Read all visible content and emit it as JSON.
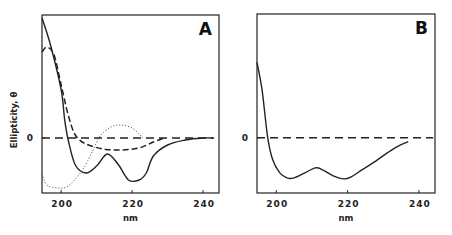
{
  "chart_data": [
    {
      "type": "line",
      "panel": "A",
      "title": "A",
      "xlabel": "nm",
      "ylabel": "Ellipticity, θ",
      "xlim": [
        194.6,
        244.5
      ],
      "ylim": [
        -0.55,
        1.23
      ],
      "xticks": [
        200,
        220,
        240
      ],
      "yticks": [
        {
          "value": 0,
          "label": "0"
        }
      ],
      "zero_line": {
        "style": "dashed",
        "x_range": [
          194.6,
          243
        ]
      },
      "grid": false,
      "series": [
        {
          "name": "solid",
          "style": "solid",
          "x": [
            194.6,
            197,
            200,
            201,
            202,
            204,
            207,
            210,
            213,
            216,
            219,
            222,
            224,
            226,
            230,
            235,
            240,
            243
          ],
          "y": [
            1.2,
            0.93,
            0.48,
            0.18,
            -0.02,
            -0.27,
            -0.35,
            -0.28,
            -0.16,
            -0.26,
            -0.42,
            -0.42,
            -0.35,
            -0.18,
            -0.07,
            -0.02,
            0.0,
            0.0
          ]
        },
        {
          "name": "dashed",
          "style": "dashed",
          "x": [
            194.6,
            196,
            198,
            200,
            202,
            204,
            207,
            212,
            217,
            222,
            226,
            229
          ],
          "y": [
            0.86,
            0.91,
            0.83,
            0.53,
            0.23,
            0.03,
            -0.06,
            -0.11,
            -0.12,
            -0.1,
            -0.04,
            0.0
          ]
        },
        {
          "name": "dotted",
          "style": "dotted",
          "x": [
            194.6,
            196,
            199,
            202,
            206,
            209,
            211,
            214,
            217,
            220,
            222,
            223
          ],
          "y": [
            -0.36,
            -0.47,
            -0.5,
            -0.48,
            -0.32,
            -0.12,
            0.02,
            0.11,
            0.13,
            0.1,
            0.04,
            0.0
          ]
        }
      ]
    },
    {
      "type": "line",
      "panel": "B",
      "title": "B",
      "xlabel": "nm",
      "ylabel": "",
      "xlim": [
        194.6,
        244.5
      ],
      "ylim": [
        -0.55,
        1.23
      ],
      "xticks": [
        200,
        220,
        240
      ],
      "yticks": [
        {
          "value": 0,
          "label": "0"
        }
      ],
      "zero_line": {
        "style": "dashed",
        "x_range": [
          194.6,
          244
        ]
      },
      "grid": false,
      "series": [
        {
          "name": "solid",
          "style": "solid",
          "x": [
            194.6,
            196,
            197.6,
            199,
            201,
            203,
            205,
            208,
            211,
            213,
            216,
            219,
            221,
            224,
            228,
            232,
            235,
            237
          ],
          "y": [
            0.75,
            0.48,
            0.0,
            -0.22,
            -0.35,
            -0.4,
            -0.4,
            -0.35,
            -0.3,
            -0.32,
            -0.38,
            -0.41,
            -0.39,
            -0.32,
            -0.23,
            -0.13,
            -0.07,
            -0.04
          ]
        }
      ]
    }
  ]
}
